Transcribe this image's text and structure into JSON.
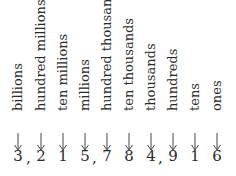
{
  "diagram": {
    "number": "3,215,784,916",
    "places": [
      {
        "digit": "3",
        "label": "billions",
        "x": 18
      },
      {
        "digit": "2",
        "label": "hundred millions",
        "x": 41
      },
      {
        "digit": "1",
        "label": "ten millions",
        "x": 63
      },
      {
        "digit": "5",
        "label": "millions",
        "x": 85
      },
      {
        "digit": "7",
        "label": "hundred thousands",
        "x": 107
      },
      {
        "digit": "8",
        "label": "ten thousands",
        "x": 129
      },
      {
        "digit": "4",
        "label": "thousands",
        "x": 151
      },
      {
        "digit": "9",
        "label": "hundreds",
        "x": 173
      },
      {
        "digit": "1",
        "label": "tens",
        "x": 195
      },
      {
        "digit": "6",
        "label": "ones",
        "x": 217
      }
    ],
    "commas": [
      {
        "char": ",",
        "x": 28
      },
      {
        "char": ",",
        "x": 94
      },
      {
        "char": ",",
        "x": 160
      }
    ]
  }
}
